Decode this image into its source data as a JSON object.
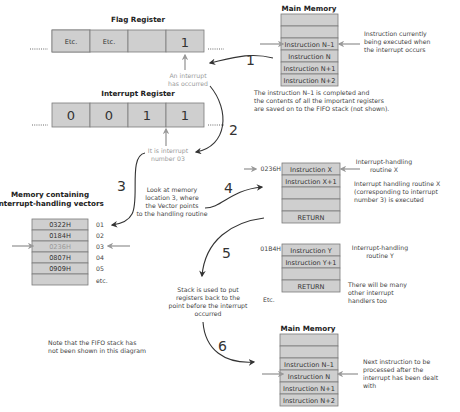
{
  "flag_register": {
    "title": "Flag Register",
    "cells": [
      "Etc.",
      "Etc.",
      "",
      "1"
    ],
    "annotation": [
      "An interrupt",
      "has occurred"
    ]
  },
  "interrupt_register": {
    "title": "Interrupt Register",
    "cells": [
      "0",
      "0",
      "1",
      "1"
    ],
    "annotation": [
      "It is interrupt",
      "number 03"
    ]
  },
  "main_memory_top": {
    "title": "Main Memory",
    "cells": [
      "",
      "",
      "Instruction N–1",
      "Instruction N",
      "Instruction N+1",
      "Instruction N+2"
    ],
    "annotation": [
      "Instruction currently",
      "being executed when",
      "the interrupt occurs"
    ],
    "caption": [
      "The instruction N–1 is completed and",
      "the contents of all the important registers",
      "are saved on to the FIFO stack (not shown)."
    ]
  },
  "vector_memory": {
    "title": [
      "Memory containing",
      "interrupt-handling vectors"
    ],
    "cells": [
      "0322H",
      "0184H",
      "0236H",
      "0807H",
      "0909H",
      ""
    ],
    "indices": [
      "01",
      "02",
      "03",
      "04",
      "05",
      "etc."
    ],
    "annotation": [
      "Look at memory",
      "location 3, where",
      "the Vector points",
      "to the handling routine"
    ]
  },
  "routine_x": {
    "address": "0236H",
    "cells": [
      "Instruction X",
      "Instruction X+1",
      "",
      "",
      "RETURN"
    ],
    "label": [
      "Interrupt-handling",
      "routine X"
    ],
    "annotation": [
      "Interrupt handling routine X",
      "(corresponding to interrupt",
      "number 3) is executed"
    ]
  },
  "routine_y": {
    "address": "01B4H",
    "cells": [
      "Instruction Y",
      "Instruction Y+1",
      "",
      "RETURN"
    ],
    "label": [
      "Interrupt-handling",
      "routine Y"
    ],
    "annotation": [
      "There will be many",
      "other interrupt",
      "handlers too"
    ],
    "etc": "Etc."
  },
  "stack_note": [
    "Stack is used to put",
    "registers back to the",
    "point before the interrupt",
    "occurred"
  ],
  "fifo_note": [
    "Note that the FIFO stack has",
    "not been shown in this diagram"
  ],
  "main_memory_bottom": {
    "title": "Main Memory",
    "cells": [
      "",
      "",
      "Instruction N–1",
      "Instruction N",
      "Instruction N+1",
      "Instruction N+2"
    ],
    "annotation": [
      "Next instruction to be",
      "processed after the",
      "interrupt has been dealt",
      "with"
    ]
  },
  "steps": [
    "1",
    "2",
    "3",
    "4",
    "5",
    "6"
  ],
  "colors": {
    "cell_fill": "#cfcfcf",
    "cell_stroke": "#7a7a7a",
    "highlight_text": "#9a9a9a",
    "arrow_dark": "#333333",
    "arrow_grey": "#999999"
  }
}
